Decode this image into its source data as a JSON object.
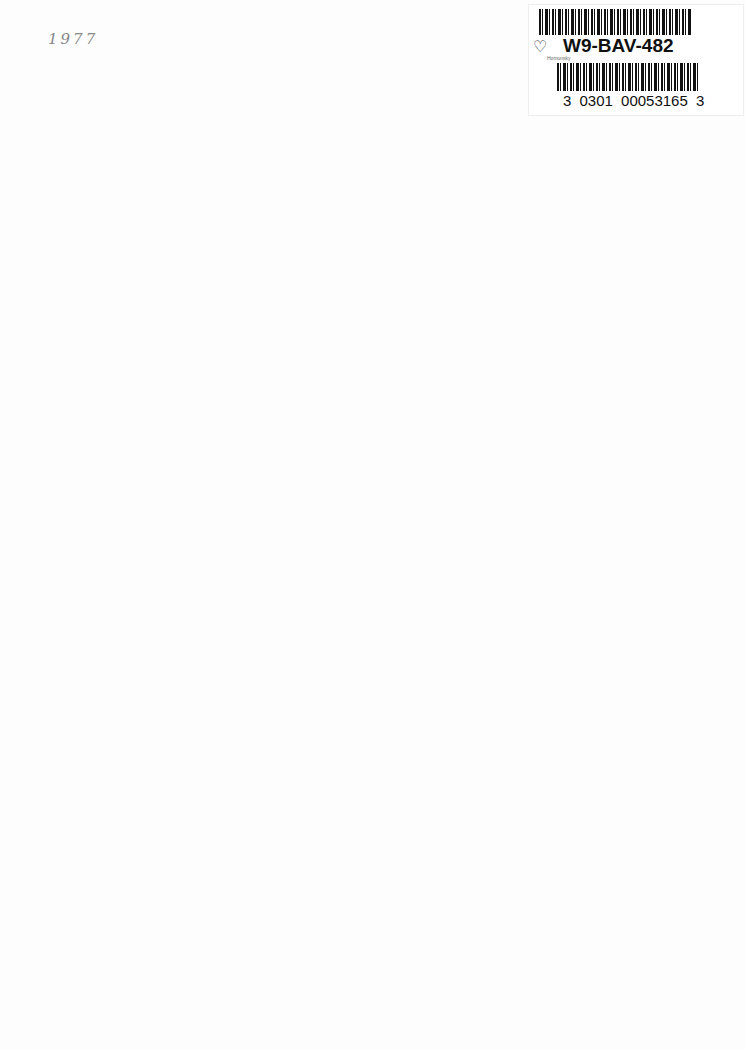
{
  "annotation": {
    "year": "1977"
  },
  "library_label": {
    "call_id": "W9-BAV-482",
    "small_text": "Homunsky",
    "barcode_number": "3 0301 00053165 3"
  }
}
